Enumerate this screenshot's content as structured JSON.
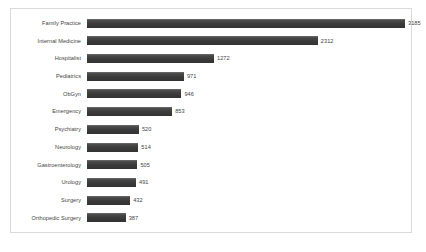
{
  "chart_data": {
    "type": "bar",
    "orientation": "horizontal",
    "title": "",
    "xlabel": "",
    "ylabel": "",
    "grid": false,
    "legend": false,
    "xlim": [
      0,
      3185
    ],
    "categories": [
      "Family Practice",
      "Internal Medicine",
      "Hospitalist",
      "Pediatrics",
      "ObGyn",
      "Emergency",
      "Psychiatry",
      "Neurology",
      "Gastroenterology",
      "Urology",
      "Surgery",
      "Orthopedic Surgery"
    ],
    "values": [
      3185,
      2312,
      1272,
      971,
      946,
      853,
      520,
      514,
      505,
      491,
      432,
      387
    ],
    "bar_color": "#3a3a3a",
    "background_color": "#ffffff",
    "border_color": "#d9d9d9"
  }
}
